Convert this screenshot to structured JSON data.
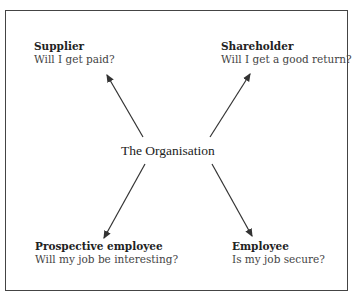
{
  "diagram": {
    "center": {
      "label": "The Organisation"
    },
    "stakeholders": [
      {
        "name": "Supplier",
        "question": "Will I get paid?",
        "position": "top-left"
      },
      {
        "name": "Shareholder",
        "question": "Will I get a good return?",
        "position": "top-right"
      },
      {
        "name": "Prospective employee",
        "question": "Will my job be interesting?",
        "position": "bottom-left"
      },
      {
        "name": "Employee",
        "question": "Is my job secure?",
        "position": "bottom-right"
      }
    ],
    "colors": {
      "line": "#333333",
      "text": "#222222",
      "border": "#444444"
    }
  }
}
